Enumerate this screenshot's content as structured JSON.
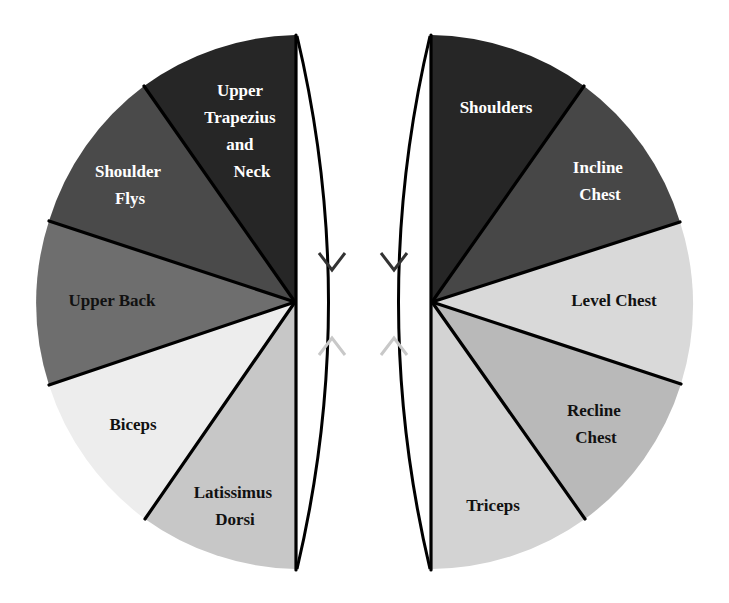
{
  "diagram": {
    "title": "",
    "left_pie": {
      "center": [
        295,
        302
      ],
      "radius": 267,
      "wedges": [
        {
          "id": "upper-trapezius-neck",
          "lines": [
            "Upper",
            "Trapezius",
            "and",
            "Neck"
          ],
          "color": "#262626",
          "text_color": "#ffffff"
        },
        {
          "id": "shoulder-flys",
          "lines": [
            "Shoulder",
            "Flys"
          ],
          "color": "#4a4a4a",
          "text_color": "#ffffff"
        },
        {
          "id": "upper-back",
          "lines": [
            "Upper Back"
          ],
          "color": "#6e6e6e",
          "text_color": "#111111"
        },
        {
          "id": "biceps",
          "lines": [
            "Biceps"
          ],
          "color": "#ededed",
          "text_color": "#111111"
        },
        {
          "id": "latissimus-dorsi",
          "lines": [
            "Latissimus",
            "Dorsi"
          ],
          "color": "#c7c7c7",
          "text_color": "#111111"
        }
      ]
    },
    "right_pie": {
      "center": [
        432,
        302
      ],
      "radius": 267,
      "wedges": [
        {
          "id": "shoulders",
          "lines": [
            "Shoulders"
          ],
          "color": "#262626",
          "text_color": "#ffffff"
        },
        {
          "id": "incline-chest",
          "lines": [
            "Incline",
            "Chest"
          ],
          "color": "#474747",
          "text_color": "#ffffff"
        },
        {
          "id": "level-chest",
          "lines": [
            "Level Chest"
          ],
          "color": "#d9d9d9",
          "text_color": "#111111"
        },
        {
          "id": "recline-chest",
          "lines": [
            "Recline",
            "Chest"
          ],
          "color": "#b9b9b9",
          "text_color": "#111111"
        },
        {
          "id": "triceps",
          "lines": [
            "Triceps"
          ],
          "color": "#d3d3d3",
          "text_color": "#111111"
        }
      ]
    },
    "connectors": {
      "arc_color": "#000000",
      "down_arrow_color": "#333333",
      "up_arrow_color": "#c8c8c8",
      "icons": [
        "arrow-down-icon",
        "arrow-up-icon"
      ]
    }
  }
}
